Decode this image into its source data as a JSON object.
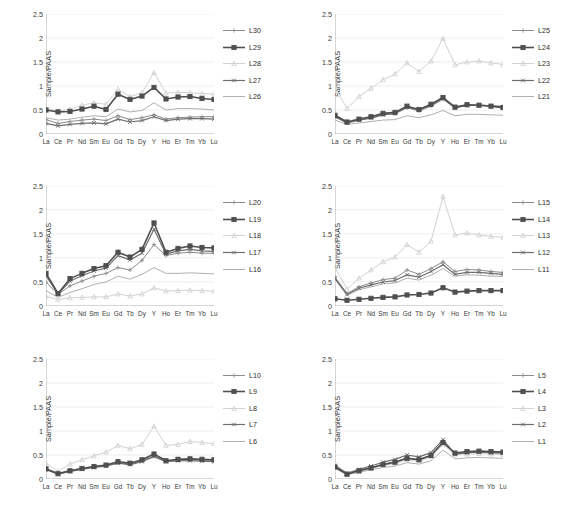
{
  "figure": {
    "axis": {
      "ylabel": "Sample/PAAS",
      "yticks": [
        "0",
        "0.5",
        "1",
        "1.5",
        "2",
        "2.5"
      ],
      "ytick_values": [
        0,
        0.5,
        1,
        1.5,
        2,
        2.5
      ],
      "ylim": [
        0,
        2.5
      ],
      "categories": [
        "La",
        "Ce",
        "Pr",
        "Nd",
        "Sm",
        "Eu",
        "Gd",
        "Tb",
        "Dy",
        "Y",
        "Ho",
        "Er",
        "Tm",
        "Yb",
        "Lu"
      ]
    },
    "series_styles": {
      "s1": {
        "color": "#8c8c8c",
        "marker": "plus",
        "width": 1.0
      },
      "s2": {
        "color": "#4f4f4f",
        "marker": "square",
        "width": 1.6
      },
      "s3": {
        "color": "#d2d2d2",
        "marker": "tri",
        "width": 1.0
      },
      "s4": {
        "color": "#6e6e6e",
        "marker": "x",
        "width": 1.2
      },
      "s5": {
        "color": "#b0b0b0",
        "marker": "none",
        "width": 1.0
      }
    }
  },
  "chart_data": [
    {
      "type": "line",
      "panel": 1,
      "title": "",
      "xlabel": "",
      "ylabel": "Sample/PAAS",
      "ylim": [
        0,
        2.5
      ],
      "grid": true,
      "legend_position": "right",
      "categories": [
        "La",
        "Ce",
        "Pr",
        "Nd",
        "Sm",
        "Eu",
        "Gd",
        "Tb",
        "Dy",
        "Y",
        "Ho",
        "Er",
        "Tm",
        "Yb",
        "Lu"
      ],
      "series": [
        {
          "name": "L30",
          "values": [
            0.3,
            0.22,
            0.26,
            0.29,
            0.31,
            0.28,
            0.38,
            0.3,
            0.34,
            0.4,
            0.31,
            0.34,
            0.35,
            0.36,
            0.36
          ]
        },
        {
          "name": "L29",
          "values": [
            0.5,
            0.46,
            0.47,
            0.52,
            0.58,
            0.51,
            0.83,
            0.72,
            0.79,
            0.97,
            0.73,
            0.77,
            0.78,
            0.74,
            0.72
          ]
        },
        {
          "name": "L28",
          "values": [
            0.53,
            0.48,
            0.52,
            0.6,
            0.65,
            0.62,
            0.93,
            0.78,
            0.86,
            1.28,
            0.85,
            0.87,
            0.86,
            0.84,
            0.83
          ]
        },
        {
          "name": "L27",
          "values": [
            0.22,
            0.17,
            0.2,
            0.22,
            0.23,
            0.21,
            0.31,
            0.25,
            0.28,
            0.36,
            0.28,
            0.31,
            0.32,
            0.32,
            0.31
          ]
        },
        {
          "name": "L26",
          "values": [
            0.34,
            0.29,
            0.31,
            0.35,
            0.38,
            0.36,
            0.52,
            0.46,
            0.49,
            0.65,
            0.5,
            0.53,
            0.53,
            0.52,
            0.5
          ]
        }
      ]
    },
    {
      "type": "line",
      "panel": 2,
      "title": "",
      "xlabel": "",
      "ylabel": "Sample/PAAS",
      "ylim": [
        0,
        2.5
      ],
      "grid": true,
      "legend_position": "right",
      "categories": [
        "La",
        "Ce",
        "Pr",
        "Nd",
        "Sm",
        "Eu",
        "Gd",
        "Tb",
        "Dy",
        "Y",
        "Ho",
        "Er",
        "Tm",
        "Yb",
        "Lu"
      ],
      "series": [
        {
          "name": "L25",
          "values": [
            0.36,
            0.24,
            0.3,
            0.34,
            0.4,
            0.42,
            0.55,
            0.48,
            0.58,
            0.72,
            0.54,
            0.59,
            0.6,
            0.59,
            0.58
          ]
        },
        {
          "name": "L24",
          "values": [
            0.39,
            0.25,
            0.31,
            0.36,
            0.43,
            0.45,
            0.58,
            0.51,
            0.62,
            0.76,
            0.56,
            0.61,
            0.6,
            0.58,
            0.55
          ]
        },
        {
          "name": "L23",
          "values": [
            0.97,
            0.53,
            0.78,
            0.95,
            1.13,
            1.25,
            1.48,
            1.3,
            1.52,
            1.99,
            1.44,
            1.5,
            1.52,
            1.48,
            1.45
          ]
        },
        {
          "name": "L22",
          "values": [
            0.36,
            0.23,
            0.29,
            0.33,
            0.4,
            0.43,
            0.56,
            0.5,
            0.6,
            0.75,
            0.55,
            0.6,
            0.6,
            0.58,
            0.56
          ]
        },
        {
          "name": "L21",
          "values": [
            0.29,
            0.2,
            0.23,
            0.26,
            0.29,
            0.3,
            0.38,
            0.34,
            0.4,
            0.49,
            0.38,
            0.41,
            0.41,
            0.4,
            0.39
          ]
        }
      ]
    },
    {
      "type": "line",
      "panel": 3,
      "title": "",
      "xlabel": "",
      "ylabel": "Sample/PAAS",
      "ylim": [
        0,
        2.5
      ],
      "grid": true,
      "legend_position": "right",
      "categories": [
        "La",
        "Ce",
        "Pr",
        "Nd",
        "Sm",
        "Eu",
        "Gd",
        "Tb",
        "Dy",
        "Y",
        "Ho",
        "Er",
        "Tm",
        "Yb",
        "Lu"
      ],
      "series": [
        {
          "name": "L20",
          "values": [
            0.5,
            0.24,
            0.42,
            0.52,
            0.62,
            0.68,
            0.8,
            0.75,
            0.95,
            1.28,
            1.05,
            1.1,
            1.12,
            1.1,
            1.1
          ]
        },
        {
          "name": "L19",
          "values": [
            0.68,
            0.26,
            0.57,
            0.68,
            0.78,
            0.84,
            1.12,
            1.02,
            1.18,
            1.73,
            1.12,
            1.2,
            1.25,
            1.22,
            1.21
          ]
        },
        {
          "name": "L18",
          "values": [
            0.2,
            0.14,
            0.17,
            0.18,
            0.19,
            0.19,
            0.25,
            0.21,
            0.25,
            0.38,
            0.31,
            0.32,
            0.33,
            0.32,
            0.31
          ]
        },
        {
          "name": "L17",
          "values": [
            0.63,
            0.25,
            0.52,
            0.63,
            0.73,
            0.79,
            1.05,
            0.96,
            1.1,
            1.6,
            1.08,
            1.15,
            1.18,
            1.15,
            1.14
          ]
        },
        {
          "name": "L16",
          "values": [
            0.32,
            0.18,
            0.28,
            0.36,
            0.45,
            0.5,
            0.62,
            0.56,
            0.66,
            0.8,
            0.68,
            0.68,
            0.69,
            0.68,
            0.67
          ]
        }
      ]
    },
    {
      "type": "line",
      "panel": 4,
      "title": "",
      "xlabel": "",
      "ylabel": "Sample/PAAS",
      "ylim": [
        0,
        2.5
      ],
      "grid": true,
      "legend_position": "right",
      "categories": [
        "La",
        "Ce",
        "Pr",
        "Nd",
        "Sm",
        "Eu",
        "Gd",
        "Tb",
        "Dy",
        "Y",
        "Ho",
        "Er",
        "Tm",
        "Yb",
        "Lu"
      ],
      "series": [
        {
          "name": "L15",
          "values": [
            0.6,
            0.26,
            0.4,
            0.48,
            0.55,
            0.58,
            0.75,
            0.66,
            0.78,
            0.92,
            0.72,
            0.76,
            0.75,
            0.72,
            0.7
          ]
        },
        {
          "name": "L14",
          "values": [
            0.15,
            0.12,
            0.14,
            0.16,
            0.18,
            0.19,
            0.23,
            0.24,
            0.27,
            0.38,
            0.29,
            0.31,
            0.32,
            0.32,
            0.32
          ]
        },
        {
          "name": "L13",
          "values": [
            0.8,
            0.35,
            0.58,
            0.75,
            0.92,
            1.02,
            1.28,
            1.12,
            1.35,
            2.28,
            1.48,
            1.52,
            1.48,
            1.45,
            1.43
          ]
        },
        {
          "name": "L12",
          "values": [
            0.58,
            0.24,
            0.37,
            0.44,
            0.5,
            0.53,
            0.65,
            0.6,
            0.72,
            0.86,
            0.66,
            0.7,
            0.7,
            0.68,
            0.66
          ]
        },
        {
          "name": "L11",
          "values": [
            0.55,
            0.22,
            0.34,
            0.4,
            0.46,
            0.48,
            0.58,
            0.54,
            0.64,
            0.78,
            0.62,
            0.65,
            0.64,
            0.62,
            0.62
          ]
        }
      ]
    },
    {
      "type": "line",
      "panel": 5,
      "title": "",
      "xlabel": "",
      "ylabel": "Sample/PAAS",
      "ylim": [
        0,
        2.5
      ],
      "grid": true,
      "legend_position": "right",
      "categories": [
        "La",
        "Ce",
        "Pr",
        "Nd",
        "Sm",
        "Eu",
        "Gd",
        "Tb",
        "Dy",
        "Y",
        "Ho",
        "Er",
        "Tm",
        "Yb",
        "Lu"
      ],
      "series": [
        {
          "name": "L10",
          "values": [
            0.22,
            0.12,
            0.18,
            0.22,
            0.26,
            0.28,
            0.34,
            0.31,
            0.38,
            0.48,
            0.37,
            0.39,
            0.4,
            0.39,
            0.38
          ]
        },
        {
          "name": "L9",
          "values": [
            0.21,
            0.11,
            0.17,
            0.22,
            0.26,
            0.29,
            0.36,
            0.33,
            0.4,
            0.52,
            0.38,
            0.41,
            0.42,
            0.41,
            0.4
          ]
        },
        {
          "name": "L8",
          "values": [
            0.33,
            0.16,
            0.31,
            0.4,
            0.48,
            0.56,
            0.7,
            0.63,
            0.72,
            1.1,
            0.7,
            0.72,
            0.78,
            0.76,
            0.74
          ]
        },
        {
          "name": "L7",
          "values": [
            0.2,
            0.1,
            0.16,
            0.2,
            0.24,
            0.27,
            0.33,
            0.3,
            0.36,
            0.47,
            0.36,
            0.38,
            0.38,
            0.37,
            0.36
          ]
        },
        {
          "name": "L6",
          "values": [
            0.2,
            0.11,
            0.17,
            0.21,
            0.25,
            0.27,
            0.33,
            0.3,
            0.37,
            0.46,
            0.36,
            0.38,
            0.38,
            0.38,
            0.37
          ]
        }
      ]
    },
    {
      "type": "line",
      "panel": 6,
      "title": "",
      "xlabel": "",
      "ylabel": "Sample/PAAS",
      "ylim": [
        0,
        2.5
      ],
      "grid": true,
      "legend_position": "right",
      "categories": [
        "La",
        "Ce",
        "Pr",
        "Nd",
        "Sm",
        "Eu",
        "Gd",
        "Tb",
        "Dy",
        "Y",
        "Ho",
        "Er",
        "Tm",
        "Yb",
        "Lu"
      ],
      "series": [
        {
          "name": "L5",
          "values": [
            0.26,
            0.11,
            0.18,
            0.24,
            0.31,
            0.36,
            0.44,
            0.41,
            0.5,
            0.78,
            0.52,
            0.55,
            0.56,
            0.55,
            0.54
          ]
        },
        {
          "name": "L4",
          "values": [
            0.25,
            0.1,
            0.17,
            0.23,
            0.3,
            0.35,
            0.43,
            0.4,
            0.49,
            0.76,
            0.54,
            0.57,
            0.58,
            0.57,
            0.56
          ]
        },
        {
          "name": "L3",
          "values": [
            0.24,
            0.1,
            0.16,
            0.22,
            0.28,
            0.32,
            0.4,
            0.37,
            0.46,
            0.72,
            0.5,
            0.52,
            0.53,
            0.52,
            0.51
          ]
        },
        {
          "name": "L2",
          "values": [
            0.28,
            0.12,
            0.2,
            0.27,
            0.35,
            0.41,
            0.5,
            0.46,
            0.55,
            0.82,
            0.52,
            0.55,
            0.56,
            0.55,
            0.54
          ]
        },
        {
          "name": "L à3",
          "values": [
            0.22,
            0.09,
            0.14,
            0.19,
            0.24,
            0.27,
            0.34,
            0.31,
            0.38,
            0.6,
            0.42,
            0.44,
            0.45,
            0.44,
            0.43
          ]
        }
      ]
    }
  ],
  "legends": [
    {
      "panel": 1,
      "items": [
        {
          "label": "L30",
          "style": "s1"
        },
        {
          "label": "L29",
          "style": "s2"
        },
        {
          "label": "L28",
          "style": "s3"
        },
        {
          "label": "L27",
          "style": "s4"
        },
        {
          "label": "L26",
          "style": "s5"
        }
      ]
    },
    {
      "panel": 2,
      "items": [
        {
          "label": "L25",
          "style": "s1"
        },
        {
          "label": "L24",
          "style": "s2"
        },
        {
          "label": "L23",
          "style": "s3"
        },
        {
          "label": "L22",
          "style": "s4"
        },
        {
          "label": "L21",
          "style": "s5"
        }
      ]
    },
    {
      "panel": 3,
      "items": [
        {
          "label": "L20",
          "style": "s1"
        },
        {
          "label": "L19",
          "style": "s2"
        },
        {
          "label": "L18",
          "style": "s3"
        },
        {
          "label": "L17",
          "style": "s4"
        },
        {
          "label": "L16",
          "style": "s5"
        }
      ]
    },
    {
      "panel": 4,
      "items": [
        {
          "label": "L15",
          "style": "s1"
        },
        {
          "label": "L14",
          "style": "s2"
        },
        {
          "label": "L13",
          "style": "s3"
        },
        {
          "label": "L12",
          "style": "s4"
        },
        {
          "label": "L11",
          "style": "s5"
        }
      ]
    },
    {
      "panel": 5,
      "items": [
        {
          "label": "L10",
          "style": "s1"
        },
        {
          "label": "L9",
          "style": "s2"
        },
        {
          "label": "L8",
          "style": "s3"
        },
        {
          "label": "L7",
          "style": "s4"
        },
        {
          "label": "L6",
          "style": "s5"
        }
      ]
    },
    {
      "panel": 6,
      "items": [
        {
          "label": "L5",
          "style": "s1"
        },
        {
          "label": "L4",
          "style": "s2"
        },
        {
          "label": "L3",
          "style": "s3"
        },
        {
          "label": "L2",
          "style": "s4"
        },
        {
          "label": "L1",
          "style": "s5"
        }
      ]
    }
  ]
}
